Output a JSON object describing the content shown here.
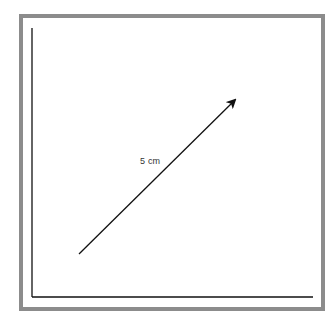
{
  "diagram": {
    "type": "vector-diagram",
    "frame_color": "#8c8c8c",
    "axis_color": "#111111",
    "arrow_color": "#111111",
    "axes": {
      "y_axis": {
        "x1": 32,
        "y1": 28,
        "x2": 32,
        "y2": 297
      },
      "x_axis": {
        "x1": 32,
        "y1": 297,
        "x2": 313,
        "y2": 297
      }
    },
    "arrow": {
      "x1": 79,
      "y1": 254,
      "x2": 235,
      "y2": 100
    },
    "label": {
      "text": "5 cm",
      "x": 140,
      "y": 156
    }
  }
}
